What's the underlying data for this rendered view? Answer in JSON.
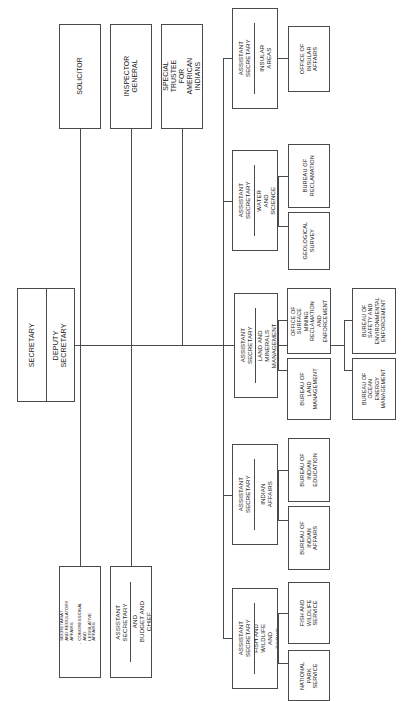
{
  "chart": {
    "orientation": "rotated-90-ccw",
    "line_color": "#4a4a4a",
    "background": "#ffffff"
  },
  "root": {
    "secretary": "SECRETARY",
    "deputy_secretary": "DEPUTY SECRETARY"
  },
  "staff_offices": [
    {
      "label": "SOLICITOR"
    },
    {
      "label": "INSPECTOR GENERAL"
    },
    {
      "label": "SPECIAL\nTRUSTEE FOR\nAMERICAN INDIANS"
    }
  ],
  "support_offices": {
    "bullet_box": {
      "items": [
        "EXECUTIVE SECRETARIAT\nAND REGULATORY AFFAIRS",
        "CONGRESSIONAL AND\nLEGISLATIVE AFFAIRS",
        "COMMUNICATIONS"
      ],
      "bullet_glyph": "-"
    },
    "cfo_box": {
      "title": "ASSISTANT SECRETARY",
      "unit": "POLICY, MANAGEMENT, AND\nBUDGET AND\nCHIEF FINANCIAL OFFICER"
    }
  },
  "assistant_secretaries": [
    {
      "title": "ASSISTANT SECRETARY",
      "unit": "INSULAR AREAS",
      "bureaus": [
        {
          "label": "OFFICE OF\nINSULAR\nAFFAIRS"
        }
      ]
    },
    {
      "title": "ASSISTANT SECRETARY",
      "unit": "WATER AND SCIENCE",
      "bureaus": [
        {
          "label": "BUREAU OF\nRECLAMATION"
        },
        {
          "label": "GEOLOGICAL\nSURVEY"
        }
      ]
    },
    {
      "title": "ASSISTANT SECRETARY",
      "unit": "LAND AND MINERALS\nMANAGEMENT",
      "bureaus": [
        {
          "label": "OFFICE OF\nSURFACE\nMINING\nRECLAMATION\nAND\nENFORCEMENT"
        },
        {
          "label": "BUREAU OF\nLAND\nMANAGEMENT"
        }
      ],
      "sub_bureaus": [
        {
          "label": "BUREAU OF\nSAFETY AND\nENVIRONMENTAL\nENFORCEMENT"
        },
        {
          "label": "BUREAU OF\nOCEAN ENERGY\nMANAGEMENT"
        }
      ]
    },
    {
      "title": "ASSISTANT SECRETARY",
      "unit": "INDIAN AFFAIRS",
      "bureaus": [
        {
          "label": "BUREAU OF\nINDIAN\nEDUCATION"
        },
        {
          "label": "BUREAU OF\nINDIAN AFFAIRS"
        }
      ]
    },
    {
      "title": "ASSISTANT SECRETARY",
      "unit": "FISH AND WILDLIFE\nAND PARKS",
      "bureaus": [
        {
          "label": "FISH AND\nWILDLIFE\nSERVICE"
        },
        {
          "label": "NATIONAL\nPARK SERVICE"
        }
      ]
    }
  ]
}
